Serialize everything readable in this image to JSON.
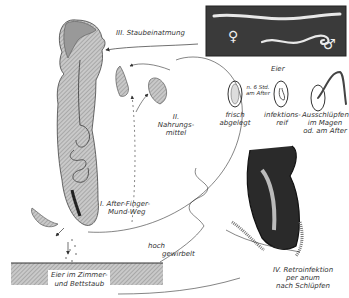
{
  "diagram": {
    "labels": {
      "route_3": "III. Staubeinatmung",
      "route_2_num": "II.",
      "route_2_a": "Nahrungs-",
      "route_2_b": "mittel",
      "route_1_a": "I. After-Finger-",
      "route_1_b": "Mund-Weg",
      "route_4_a": "IV. Retroinfektion",
      "route_4_b": "per anum",
      "route_4_c": "nach Schlüpfen",
      "eggs_title": "Eier",
      "egg_1_a": "frisch",
      "egg_1_b": "abgelegt",
      "egg_interval_a": "n. 6 Std.",
      "egg_interval_b": "am After",
      "egg_2_a": "infektions-",
      "egg_2_b": "reif",
      "egg_3_a": "Ausschlüpfen",
      "egg_3_b": "im Magen",
      "egg_3_c": "od. am After",
      "floor_a": "Eier im Zimmer-",
      "floor_b": "und Bettstaub",
      "dust_a": "hoch",
      "dust_b": "gewirbelt",
      "female_symbol": "♀",
      "male_symbol": "♂"
    },
    "colors": {
      "ink": "#333333",
      "body_fill": "#b8b8b8",
      "photo_bg": "#3a3a3a",
      "worm": "#e8e8e8"
    }
  }
}
